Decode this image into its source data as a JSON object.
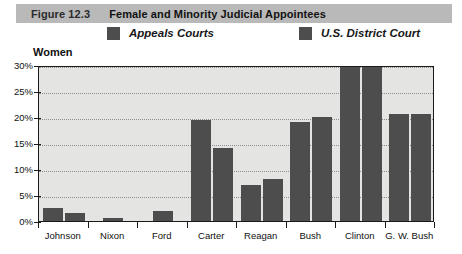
{
  "figure": {
    "number": "Figure 12.3",
    "title": "Female and Minority Judicial Appointees"
  },
  "panel": {
    "subtitle": "Women"
  },
  "legend": [
    {
      "label": "Appeals Courts",
      "color": "#4d4d4d",
      "swatch_icon": "legend-swatch-icon"
    },
    {
      "label": "U.S. District Court",
      "color": "#4d4d4d",
      "swatch_icon": "legend-swatch-icon"
    }
  ],
  "colors": {
    "header_background": "#b9b9b9",
    "plot_background": "#e4e4e2",
    "bar": "#4d4d4d",
    "axis": "#1a1a1a",
    "gridline": "#8c8c8c"
  },
  "chart_data": {
    "type": "bar",
    "title": "Female and Minority Judicial Appointees",
    "subtitle": "Women",
    "xlabel": "",
    "ylabel": "",
    "ylim": [
      0,
      30
    ],
    "yticks": [
      0,
      5,
      10,
      15,
      20,
      25,
      30
    ],
    "ytick_labels": [
      "0%",
      "5%",
      "10%",
      "15%",
      "20%",
      "25%",
      "30%"
    ],
    "grid": true,
    "legend_position": "top",
    "categories": [
      "Johnson",
      "Nixon",
      "Ford",
      "Carter",
      "Reagan",
      "Bush",
      "Clinton",
      "G. W. Bush"
    ],
    "series": [
      {
        "name": "Appeals Courts",
        "color": "#4d4d4d",
        "values": [
          2.5,
          null,
          null,
          19.5,
          7.0,
          19.0,
          30.0,
          20.5
        ]
      },
      {
        "name": "U.S. District Court",
        "color": "#4d4d4d",
        "values": [
          1.6,
          0.6,
          1.9,
          14.0,
          8.0,
          20.0,
          30.0,
          20.5
        ]
      }
    ]
  }
}
